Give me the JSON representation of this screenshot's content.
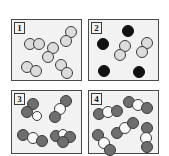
{
  "figure": {
    "background_color": "#ffffff",
    "panel_fill": "#f2f2f2",
    "panel_border_color": "#4a4a4a",
    "atom_colors": {
      "light": "#dcdcdc",
      "dark": "#111111",
      "mid": "#6e6e6e",
      "white": "#fbfbfb"
    }
  },
  "panels": [
    {
      "id": "panel-1",
      "label": "1",
      "rect": {
        "x": 11,
        "y": 19,
        "w": 71,
        "h": 62
      },
      "description": "five identical diatomic molecules, two light-gray atoms each",
      "species_counts": {
        "light-light diatomic": 5
      },
      "molecules": [
        {
          "type": "diatomic",
          "atoms": [
            {
              "shade": "light",
              "cx": 18,
              "cy": 24,
              "r": 6
            },
            {
              "shade": "light",
              "cx": 27,
              "cy": 24,
              "r": 6
            }
          ]
        },
        {
          "type": "diatomic",
          "atoms": [
            {
              "shade": "light",
              "cx": 59,
              "cy": 12,
              "r": 6
            },
            {
              "shade": "light",
              "cx": 54,
              "cy": 21,
              "r": 6
            }
          ]
        },
        {
          "type": "diatomic",
          "atoms": [
            {
              "shade": "light",
              "cx": 41,
              "cy": 28,
              "r": 6
            },
            {
              "shade": "light",
              "cx": 36,
              "cy": 37,
              "r": 6
            }
          ]
        },
        {
          "type": "diatomic",
          "atoms": [
            {
              "shade": "light",
              "cx": 15,
              "cy": 47,
              "r": 6
            },
            {
              "shade": "light",
              "cx": 24,
              "cy": 51,
              "r": 6
            }
          ]
        },
        {
          "type": "diatomic",
          "atoms": [
            {
              "shade": "light",
              "cx": 49,
              "cy": 45,
              "r": 6
            },
            {
              "shade": "light",
              "cx": 55,
              "cy": 53,
              "r": 6
            }
          ]
        }
      ]
    },
    {
      "id": "panel-2",
      "label": "2",
      "rect": {
        "x": 88,
        "y": 19,
        "w": 71,
        "h": 62
      },
      "description": "four single black atoms plus two light-gray diatomic molecules",
      "species_counts": {
        "black single atom": 4,
        "light-light diatomic": 2
      },
      "molecules": [
        {
          "type": "single",
          "atoms": [
            {
              "shade": "dark",
              "cx": 39,
              "cy": 11,
              "r": 6
            }
          ]
        },
        {
          "type": "single",
          "atoms": [
            {
              "shade": "dark",
              "cx": 14,
              "cy": 24,
              "r": 6
            }
          ]
        },
        {
          "type": "single",
          "atoms": [
            {
              "shade": "dark",
              "cx": 15,
              "cy": 51,
              "r": 6
            }
          ]
        },
        {
          "type": "single",
          "atoms": [
            {
              "shade": "dark",
              "cx": 50,
              "cy": 52,
              "r": 6
            }
          ]
        },
        {
          "type": "diatomic",
          "atoms": [
            {
              "shade": "light",
              "cx": 36,
              "cy": 26,
              "r": 6
            },
            {
              "shade": "light",
              "cx": 31,
              "cy": 35,
              "r": 6
            }
          ]
        },
        {
          "type": "diatomic",
          "atoms": [
            {
              "shade": "light",
              "cx": 58,
              "cy": 23,
              "r": 6
            },
            {
              "shade": "light",
              "cx": 53,
              "cy": 32,
              "r": 6
            }
          ]
        }
      ]
    },
    {
      "id": "panel-3",
      "label": "3",
      "rect": {
        "x": 11,
        "y": 90,
        "w": 71,
        "h": 64
      },
      "description": "four triatomic molecules made of one white atom and two dark-gray atoms",
      "species_counts": {
        "dark-white-dark triatomic": 4
      },
      "molecules": [
        {
          "type": "triatomic",
          "atoms": [
            {
              "shade": "mid",
              "cx": 21,
              "cy": 13,
              "r": 6
            },
            {
              "shade": "mid",
              "cx": 15,
              "cy": 21,
              "r": 6
            },
            {
              "shade": "white",
              "cx": 25,
              "cy": 25,
              "r": 5
            }
          ]
        },
        {
          "type": "triatomic",
          "atoms": [
            {
              "shade": "mid",
              "cx": 54,
              "cy": 10,
              "r": 6
            },
            {
              "shade": "white",
              "cx": 48,
              "cy": 18,
              "r": 6
            },
            {
              "shade": "mid",
              "cx": 43,
              "cy": 26,
              "r": 6
            }
          ]
        },
        {
          "type": "triatomic",
          "atoms": [
            {
              "shade": "mid",
              "cx": 11,
              "cy": 44,
              "r": 6
            },
            {
              "shade": "white",
              "cx": 21,
              "cy": 47,
              "r": 6
            },
            {
              "shade": "mid",
              "cx": 30,
              "cy": 50,
              "r": 6
            }
          ]
        },
        {
          "type": "triatomic",
          "atoms": [
            {
              "shade": "mid",
              "cx": 44,
              "cy": 45,
              "r": 6
            },
            {
              "shade": "white",
              "cx": 51,
              "cy": 43,
              "r": 5
            },
            {
              "shade": "mid",
              "cx": 58,
              "cy": 46,
              "r": 6
            },
            {
              "shade": "mid",
              "cx": 51,
              "cy": 51,
              "r": 6
            }
          ]
        }
      ]
    },
    {
      "id": "panel-4",
      "label": "4",
      "rect": {
        "x": 88,
        "y": 90,
        "w": 71,
        "h": 64
      },
      "description": "five linear triatomic molecules, dark-gray / white / dark-gray",
      "species_counts": {
        "dark-white-dark triatomic": 5
      },
      "molecules": [
        {
          "type": "triatomic",
          "atoms": [
            {
              "shade": "mid",
              "cx": 40,
              "cy": 11,
              "r": 6
            },
            {
              "shade": "white",
              "cx": 49,
              "cy": 14,
              "r": 6
            },
            {
              "shade": "mid",
              "cx": 58,
              "cy": 17,
              "r": 6
            }
          ]
        },
        {
          "type": "triatomic",
          "atoms": [
            {
              "shade": "mid",
              "cx": 10,
              "cy": 23,
              "r": 6
            },
            {
              "shade": "white",
              "cx": 19,
              "cy": 21,
              "r": 6
            },
            {
              "shade": "mid",
              "cx": 28,
              "cy": 20,
              "r": 6
            }
          ]
        },
        {
          "type": "triatomic",
          "atoms": [
            {
              "shade": "mid",
              "cx": 28,
              "cy": 42,
              "r": 6
            },
            {
              "shade": "white",
              "cx": 36,
              "cy": 37,
              "r": 6
            },
            {
              "shade": "mid",
              "cx": 44,
              "cy": 32,
              "r": 6
            }
          ]
        },
        {
          "type": "triatomic",
          "atoms": [
            {
              "shade": "mid",
              "cx": 9,
              "cy": 44,
              "r": 6
            },
            {
              "shade": "white",
              "cx": 15,
              "cy": 52,
              "r": 6
            },
            {
              "shade": "mid",
              "cx": 21,
              "cy": 59,
              "r": 6
            }
          ]
        },
        {
          "type": "triatomic",
          "atoms": [
            {
              "shade": "mid",
              "cx": 58,
              "cy": 37,
              "r": 6
            },
            {
              "shade": "white",
              "cx": 57,
              "cy": 47,
              "r": 6
            },
            {
              "shade": "mid",
              "cx": 58,
              "cy": 56,
              "r": 6
            }
          ]
        }
      ]
    }
  ]
}
